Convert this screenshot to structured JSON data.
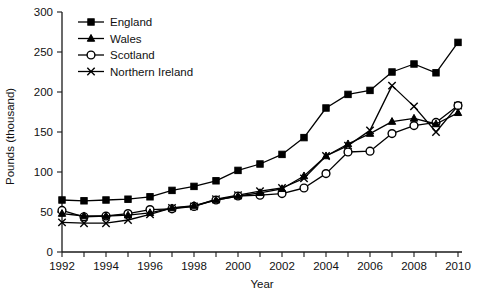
{
  "chart_data": {
    "type": "line",
    "title": "",
    "xlabel": "Year",
    "ylabel": "Pounds (thousand)",
    "xlim": [
      1992,
      2010
    ],
    "ylim": [
      0,
      300
    ],
    "ytick_step": 50,
    "xtick_label_step": 2,
    "xtick_minor_step": 1,
    "grid": false,
    "legend_position": "top-left",
    "x": [
      1992,
      1993,
      1994,
      1995,
      1996,
      1997,
      1998,
      1999,
      2000,
      2001,
      2002,
      2003,
      2004,
      2005,
      2006,
      2007,
      2008,
      2009,
      2010
    ],
    "xtick_labels": [
      "1992",
      "1994",
      "1996",
      "1998",
      "2000",
      "2002",
      "2004",
      "2006",
      "2008",
      "2010"
    ],
    "ytick_labels": [
      "0",
      "50",
      "100",
      "150",
      "200",
      "250",
      "300"
    ],
    "series": [
      {
        "name": "England",
        "marker": "filled-square",
        "values": [
          65,
          64,
          65,
          66,
          69,
          77,
          82,
          89,
          102,
          110,
          122,
          143,
          180,
          197,
          202,
          225,
          235,
          224,
          262
        ]
      },
      {
        "name": "Wales",
        "marker": "filled-triangle",
        "values": [
          48,
          45,
          45,
          46,
          49,
          55,
          58,
          65,
          70,
          74,
          79,
          95,
          120,
          135,
          148,
          163,
          167,
          160,
          174
        ]
      },
      {
        "name": "Scotland",
        "marker": "open-circle",
        "values": [
          52,
          44,
          45,
          48,
          53,
          54,
          57,
          65,
          70,
          71,
          73,
          80,
          98,
          125,
          126,
          148,
          158,
          162,
          183
        ]
      },
      {
        "name": "Northern Ireland",
        "marker": "cross",
        "values": [
          37,
          36,
          36,
          40,
          47,
          55,
          57,
          66,
          71,
          76,
          80,
          92,
          120,
          133,
          152,
          208,
          182,
          150,
          183
        ]
      }
    ]
  },
  "axes": {
    "x_axis_title": "Year",
    "y_axis_title": "Pounds (thousand)"
  },
  "legend": {
    "entries": [
      {
        "label": "England",
        "marker": "filled-square"
      },
      {
        "label": "Wales",
        "marker": "filled-triangle"
      },
      {
        "label": "Scotland",
        "marker": "open-circle"
      },
      {
        "label": "Northern Ireland",
        "marker": "cross"
      }
    ]
  }
}
